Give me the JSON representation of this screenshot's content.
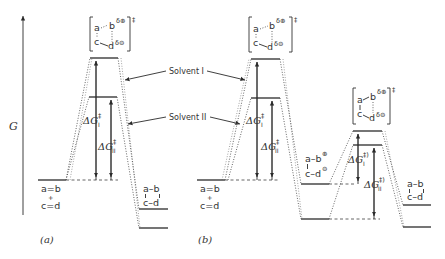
{
  "figure": {
    "axis_label": "G",
    "panels": [
      {
        "id": "a",
        "caption": "(a)",
        "reactants": {
          "line1": "a=b",
          "plus": "+",
          "line2": "c=d"
        },
        "transition_state": {
          "top": "a",
          "top_right": "b",
          "top_charge": "δ⊕",
          "bottom": "c",
          "bottom_right": "d",
          "bottom_charge": "δ⊖",
          "marker": "‡"
        },
        "product": {
          "line1": "a–b",
          "line2": "c–d"
        },
        "barriers": [
          {
            "label": "ΔG",
            "sup": "‡",
            "sub": "I"
          },
          {
            "label": "ΔG",
            "sup": "‡",
            "sub": "II"
          }
        ]
      },
      {
        "id": "b",
        "caption": "(b)",
        "reactants": {
          "line1": "a=b",
          "plus": "+",
          "line2": "c=d"
        },
        "transition_state": {
          "top": "a",
          "top_right": "b",
          "top_charge": "δ⊕",
          "bottom": "c",
          "bottom_right": "d",
          "bottom_charge": "δ⊖",
          "marker": "‡"
        },
        "intermediate": {
          "top": "a–b",
          "top_charge": "⊕",
          "bottom": "c–d",
          "bottom_charge": "⊖"
        },
        "transition_state_2": {
          "top": "a",
          "top_right": "b",
          "top_charge": "δ⊕",
          "bottom": "c",
          "bottom_right": "d",
          "bottom_charge": "δ⊖",
          "marker": "‡"
        },
        "product": {
          "line1": "a–b",
          "line2": "c–d"
        },
        "barriers": [
          {
            "label": "ΔG",
            "sup": "‡",
            "sub": "I"
          },
          {
            "label": "ΔG",
            "sup": "‡",
            "sub": "II"
          },
          {
            "label": "ΔG",
            "sup": "‡)",
            "sub": "I"
          },
          {
            "label": "ΔG",
            "sup": "‡)",
            "sub": "II"
          }
        ]
      }
    ],
    "callouts": [
      {
        "label": "Solvent I"
      },
      {
        "label": "Solvent II"
      }
    ]
  }
}
